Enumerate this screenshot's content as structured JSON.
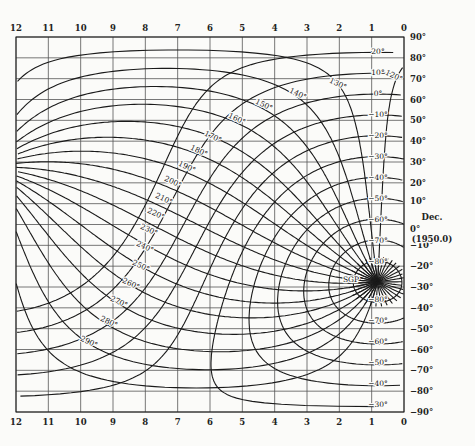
{
  "chart_data": {
    "type": "line",
    "xlabel": "Right Ascension (hours)",
    "ylabel": "Dec. (1950.0)",
    "x_ticks": [
      "12",
      "11",
      "10",
      "9",
      "8",
      "7",
      "6",
      "5",
      "4",
      "3",
      "2",
      "1",
      "0"
    ],
    "y_ticks": [
      "90°",
      "80°",
      "70°",
      "60°",
      "50°",
      "40°",
      "30°",
      "20°",
      "10°",
      "0°",
      "−10°",
      "−20°",
      "−30°",
      "−40°",
      "−50°",
      "−60°",
      "−70°",
      "−80°",
      "−90°"
    ],
    "xlim": [
      12,
      0
    ],
    "ylim": [
      -90,
      90
    ],
    "grid": true,
    "dec_axis_label": "Dec.",
    "epoch_label": "(1950.0)",
    "pole_label": "SGP",
    "latitude_curves": [
      20,
      10,
      0,
      -10,
      -20,
      -30,
      -40,
      -50,
      -60,
      -70,
      -80
    ],
    "latitude_labels_upper": [
      "20°",
      "10°",
      "0°",
      "−10°",
      "−20°",
      "−30°",
      "−40°",
      "−50°",
      "−60°",
      "−70°",
      "−80°"
    ],
    "latitude_labels_lower": [
      "−80°",
      "−70°",
      "−60°",
      "−50°",
      "−40°",
      "−30°"
    ],
    "longitude_curves": [
      120,
      130,
      140,
      150,
      160,
      170,
      180,
      190,
      200,
      210,
      220,
      230,
      240,
      250,
      260,
      270,
      280,
      290
    ],
    "longitude_labels": [
      "120°",
      "130°",
      "140°",
      "150°",
      "160°",
      "170°",
      "180°",
      "190°",
      "200°",
      "210°",
      "220°",
      "230°",
      "240°",
      "250°",
      "260°",
      "270°",
      "280°",
      "290°"
    ]
  },
  "frame": {
    "left": 16,
    "right": 404,
    "top": 37,
    "bottom": 412
  },
  "colors": {
    "ink": "#1a1a1a",
    "grid": "#555555",
    "paper": "#fbfbf9"
  }
}
